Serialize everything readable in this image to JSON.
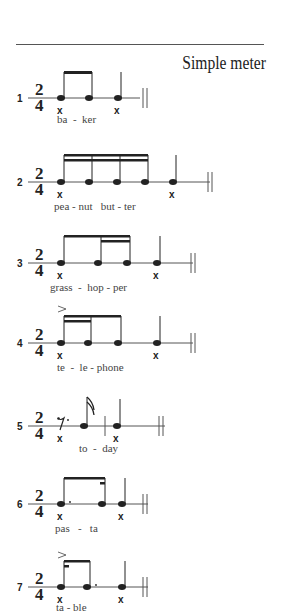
{
  "header": {
    "title": "Simple meter"
  },
  "time_signature": {
    "top": "2",
    "bottom": "4"
  },
  "examples": [
    {
      "number": "1",
      "lyrics": "ba  -  ker",
      "word": "baker",
      "rhythm": "two eighths + quarter"
    },
    {
      "number": "2",
      "lyrics": "pea - nut   but - ter",
      "word": "peanut butter",
      "rhythm": "four sixteenths + quarter"
    },
    {
      "number": "3",
      "lyrics": "grass  -  hop - per",
      "word": "grasshopper",
      "rhythm": "eighth + two sixteenths + quarter"
    },
    {
      "number": "4",
      "lyrics": "te  -  le - phone",
      "word": "telephone",
      "rhythm": "two sixteenths + eighth (accent) + quarter"
    },
    {
      "number": "5",
      "lyrics": "to  -  day",
      "word": "today",
      "rhythm": "dotted eighth rest + sixteenth | quarter"
    },
    {
      "number": "6",
      "lyrics": "pas   -   ta",
      "word": "pasta",
      "rhythm": "dotted eighth + sixteenth + quarter"
    },
    {
      "number": "7",
      "lyrics": "ta - ble",
      "word": "table",
      "rhythm": "sixteenth (accent) + dotted eighth + quarter"
    }
  ],
  "beat_mark": "x"
}
